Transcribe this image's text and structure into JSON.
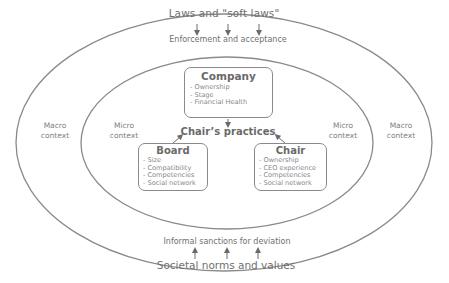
{
  "diagram": {
    "colors": {
      "line": "#8a8a8a",
      "text": "#6a6a6a",
      "background": "#ffffff"
    },
    "outer_ellipse": {
      "top_label": "Laws and \"soft laws\"",
      "top_sublabel": "Enforcement and acceptance",
      "bottom_label": "Societal norms and values",
      "bottom_sublabel": "Informal sanctions for deviation",
      "left_label": [
        "Macro",
        "context"
      ],
      "right_label": [
        "Macro",
        "context"
      ]
    },
    "inner_ellipse": {
      "left_label": [
        "Micro",
        "context"
      ],
      "right_label": [
        "Micro",
        "context"
      ]
    },
    "center": {
      "label": "Chair’s practices"
    },
    "boxes": {
      "company": {
        "title": "Company",
        "items": [
          "- Ownership",
          "- Stage",
          "- Financial Health"
        ]
      },
      "board": {
        "title": "Board",
        "items": [
          "- Size",
          "- Compatibility",
          "- Competencies",
          "- Social network"
        ]
      },
      "chair": {
        "title": "Chair",
        "items": [
          "- Ownership",
          "- CEO experience",
          "- Competencies",
          "- Social network"
        ]
      }
    },
    "arrows": {
      "top": [
        "down",
        "down",
        "down"
      ],
      "bottom": [
        "up",
        "up",
        "up"
      ]
    }
  }
}
